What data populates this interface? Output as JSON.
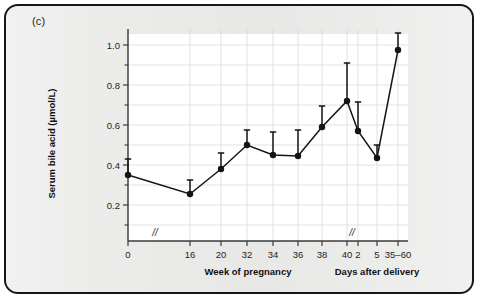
{
  "panel": {
    "label": "(c)"
  },
  "chart_data": {
    "type": "line",
    "title": "",
    "subtitle": "",
    "xlabel": "Week of pregnancy",
    "xlabel_secondary": "Days after delivery",
    "ylabel": "Serum bile acid (µmol/L)",
    "ylim": [
      0.0,
      1.08
    ],
    "yticks_major": [
      0.2,
      0.4,
      0.6,
      0.8,
      1.0
    ],
    "ytick_labels": [
      "0.2",
      "0.4",
      "0.6",
      "0.8",
      "1.0"
    ],
    "yticks_minor": [
      0.1,
      0.3,
      0.5,
      0.7,
      0.9
    ],
    "grid": true,
    "legend": "none",
    "axis_breaks": [
      "between week 0 and week 16",
      "between week 40 and day 2"
    ],
    "break_symbol": "//",
    "categories": [
      "0",
      "16",
      "20",
      "32",
      "34",
      "36",
      "38",
      "40",
      "2",
      "5",
      "35–60"
    ],
    "xtick_labels": [
      "0",
      "16",
      "20",
      "32",
      "34",
      "36",
      "38",
      "40",
      "2",
      "5",
      "35–60"
    ],
    "series": [
      {
        "name": "Serum bile acid",
        "marker": "filled-circle",
        "values": [
          0.35,
          0.255,
          0.38,
          0.5,
          0.45,
          0.445,
          0.59,
          0.72,
          0.57,
          0.435,
          0.975
        ],
        "error_upper": [
          0.43,
          0.325,
          0.46,
          0.575,
          0.565,
          0.575,
          0.695,
          0.91,
          0.715,
          0.5,
          1.06
        ]
      }
    ]
  }
}
